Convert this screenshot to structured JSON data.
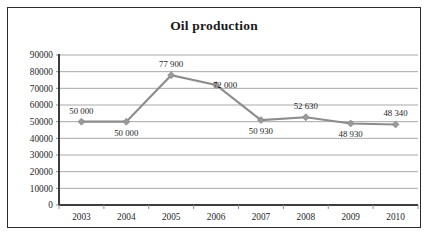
{
  "chart_data": {
    "type": "line",
    "title": "Oil production",
    "xlabel": "",
    "ylabel": "",
    "categories": [
      "2003",
      "2004",
      "2005",
      "2006",
      "2007",
      "2008",
      "2009",
      "2010"
    ],
    "values": [
      50000,
      50000,
      77900,
      72000,
      50930,
      52630,
      48930,
      48340
    ],
    "point_labels": [
      "50 000",
      "50 000",
      "77 900",
      "72 000",
      "50 930",
      "52 630",
      "48 930",
      "48 340"
    ],
    "point_label_positions": [
      "above",
      "below",
      "above",
      "right",
      "below",
      "above",
      "below",
      "above"
    ],
    "ylim": [
      0,
      90000
    ],
    "ytick_step": 10000,
    "ytick_labels": [
      "90000",
      "80000",
      "70000",
      "60000",
      "50000",
      "40000",
      "30000",
      "20000",
      "10000",
      "0"
    ],
    "grid": true,
    "legend": "none",
    "series_color": "#8c8c8c",
    "marker": "diamond",
    "marker_color": "#9a9a9a",
    "grid_color": "#a8a8a8",
    "axis_color": "#3d3d3d",
    "border_color": "#2b2b2b",
    "background": "#ffffff"
  }
}
